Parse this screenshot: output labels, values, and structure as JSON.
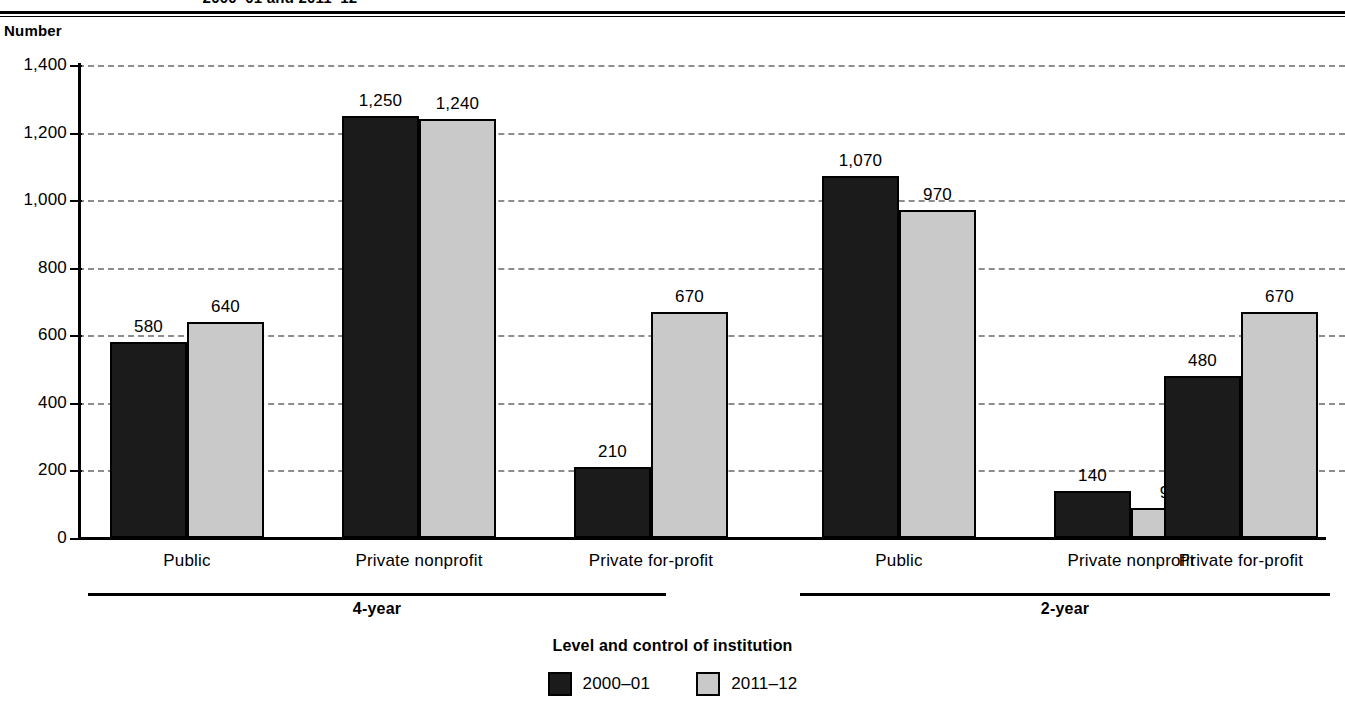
{
  "chart_data": {
    "type": "bar",
    "title": "2000–01 and 2011–12",
    "ylabel": "Number",
    "xlabel": "Level and control of institution",
    "ylim": [
      0,
      1400
    ],
    "yticks": [
      0,
      200,
      400,
      600,
      800,
      1000,
      1200,
      1400
    ],
    "ytick_labels": [
      "0",
      "200",
      "400",
      "600",
      "800",
      "1,000",
      "1,200",
      "1,400"
    ],
    "grid": true,
    "legend_position": "bottom",
    "categories": [
      "Public",
      "Private nonprofit",
      "Private for-profit",
      "Public",
      "Private nonprofit",
      "Private for-profit"
    ],
    "groups": [
      {
        "label": "4-year",
        "categories": [
          "Public",
          "Private nonprofit",
          "Private for-profit"
        ]
      },
      {
        "label": "2-year",
        "categories": [
          "Public",
          "Private nonprofit",
          "Private for-profit"
        ]
      }
    ],
    "series": [
      {
        "name": "2000–01",
        "color": "#1b1b1b",
        "values": [
          580,
          1250,
          210,
          1070,
          140,
          480
        ],
        "labels": [
          "580",
          "1,250",
          "210",
          "1,070",
          "140",
          "480"
        ]
      },
      {
        "name": "2011–12",
        "color": "#c9c9c9",
        "values": [
          640,
          1240,
          670,
          970,
          90,
          670
        ],
        "labels": [
          "640",
          "1,240",
          "670",
          "970",
          "90",
          "670"
        ]
      }
    ]
  },
  "legend": {
    "items": [
      {
        "label": "2000–01",
        "swatch": "dark"
      },
      {
        "label": "2011–12",
        "swatch": "light"
      }
    ]
  }
}
